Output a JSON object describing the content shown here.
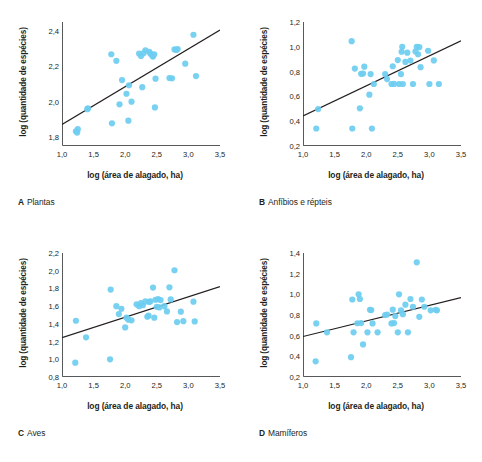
{
  "figure": {
    "axis_titles": {
      "x": "log (área de alagado, ha)",
      "y": "log (quantidade de espécies)"
    },
    "marker_color": "#6ecdf0",
    "line_color": "#231f20",
    "axis_color": "#58595b",
    "background": "#ffffff"
  },
  "chart_data": [
    {
      "type": "scatter",
      "panel": "A",
      "title": "Plantas",
      "caption_letter": "A",
      "caption_text": "Plantas",
      "xlabel": "log (área de alagado, ha)",
      "ylabel": "log (quantidade de espécies)",
      "xlim": [
        1.0,
        3.5
      ],
      "ylim": [
        1.75,
        2.45
      ],
      "xticks": [
        "1,0",
        "1,5",
        "2,0",
        "2,5",
        "3,0",
        "3,5"
      ],
      "xtick_values": [
        1.0,
        1.5,
        2.0,
        2.5,
        3.0,
        3.5
      ],
      "yticks": [
        "1,8",
        "2,0",
        "2,2",
        "2,4"
      ],
      "ytick_values": [
        1.8,
        2.0,
        2.2,
        2.4
      ],
      "grid": false,
      "legend": "none",
      "trendline": {
        "x": [
          1.0,
          3.5
        ],
        "y": [
          1.872,
          2.405
        ]
      },
      "points": [
        [
          1.22,
          1.833
        ],
        [
          1.25,
          1.845
        ],
        [
          1.24,
          1.826
        ],
        [
          1.4,
          1.958
        ],
        [
          1.41,
          1.962
        ],
        [
          1.78,
          2.268
        ],
        [
          1.79,
          1.878
        ],
        [
          1.86,
          2.231
        ],
        [
          1.91,
          1.985
        ],
        [
          1.95,
          2.122
        ],
        [
          2.02,
          2.045
        ],
        [
          2.05,
          1.893
        ],
        [
          2.06,
          2.093
        ],
        [
          2.1,
          2.0
        ],
        [
          2.22,
          2.272
        ],
        [
          2.25,
          2.258
        ],
        [
          2.27,
          2.082
        ],
        [
          2.29,
          2.274
        ],
        [
          2.32,
          2.29
        ],
        [
          2.38,
          2.282
        ],
        [
          2.4,
          2.271
        ],
        [
          2.43,
          2.259
        ],
        [
          2.44,
          2.255
        ],
        [
          2.46,
          2.268
        ],
        [
          2.47,
          1.968
        ],
        [
          2.48,
          2.13
        ],
        [
          2.7,
          2.134
        ],
        [
          2.74,
          2.132
        ],
        [
          2.78,
          2.295
        ],
        [
          2.81,
          2.292
        ],
        [
          2.83,
          2.297
        ],
        [
          2.95,
          2.215
        ],
        [
          3.08,
          2.378
        ],
        [
          3.12,
          2.145
        ]
      ]
    },
    {
      "type": "scatter",
      "panel": "B",
      "title": "Anfíbios e répteis",
      "caption_letter": "B",
      "caption_text": "Anfíbios e répteis",
      "xlabel": "log (área de alagado, ha)",
      "ylabel": "log (quantidade de espécies)",
      "xlim": [
        1.0,
        3.5
      ],
      "ylim": [
        0.2,
        1.2
      ],
      "xticks": [
        "1,0",
        "1,5",
        "2,0",
        "2,5",
        "3,0",
        "3,5"
      ],
      "xtick_values": [
        1.0,
        1.5,
        2.0,
        2.5,
        3.0,
        3.5
      ],
      "yticks": [
        "0,2",
        "0,4",
        "0,6",
        "0,8",
        "1,0",
        "1,2"
      ],
      "ytick_values": [
        0.2,
        0.4,
        0.6,
        0.8,
        1.0,
        1.2
      ],
      "grid": false,
      "legend": "none",
      "trendline": {
        "x": [
          1.0,
          3.5
        ],
        "y": [
          0.443,
          1.048
        ]
      },
      "points": [
        [
          1.21,
          0.341
        ],
        [
          1.24,
          0.498
        ],
        [
          1.77,
          1.045
        ],
        [
          1.78,
          0.341
        ],
        [
          1.82,
          0.824
        ],
        [
          1.9,
          0.504
        ],
        [
          1.92,
          0.782
        ],
        [
          1.95,
          0.784
        ],
        [
          1.97,
          0.84
        ],
        [
          2.05,
          0.614
        ],
        [
          2.07,
          0.78
        ],
        [
          2.09,
          0.341
        ],
        [
          2.12,
          0.7
        ],
        [
          2.3,
          0.78
        ],
        [
          2.33,
          0.74
        ],
        [
          2.4,
          0.7
        ],
        [
          2.42,
          0.843
        ],
        [
          2.44,
          0.701
        ],
        [
          2.5,
          0.893
        ],
        [
          2.52,
          0.7
        ],
        [
          2.55,
          0.78
        ],
        [
          2.56,
          0.96
        ],
        [
          2.57,
          1.0
        ],
        [
          2.58,
          0.7
        ],
        [
          2.62,
          0.878
        ],
        [
          2.65,
          0.953
        ],
        [
          2.7,
          0.889
        ],
        [
          2.74,
          0.7
        ],
        [
          2.78,
          0.963
        ],
        [
          2.8,
          1.0
        ],
        [
          2.82,
          0.94
        ],
        [
          2.84,
          0.997
        ],
        [
          2.86,
          0.836
        ],
        [
          2.98,
          0.968
        ],
        [
          3.0,
          0.7
        ],
        [
          3.07,
          0.89
        ],
        [
          3.15,
          0.7
        ]
      ]
    },
    {
      "type": "scatter",
      "panel": "C",
      "title": "Aves",
      "caption_letter": "C",
      "caption_text": "Aves",
      "xlabel": "log (área de alagado, ha)",
      "ylabel": "log (quantidade de espécies)",
      "xlim": [
        1.0,
        3.5
      ],
      "ylim": [
        0.8,
        2.2
      ],
      "xticks": [
        "1,0",
        "1,5",
        "2,0",
        "2,5",
        "3,0",
        "3,5"
      ],
      "xtick_values": [
        1.0,
        1.5,
        2.0,
        2.5,
        3.0,
        3.5
      ],
      "yticks": [
        "0,8",
        "1,0",
        "1,2",
        "1,4",
        "1,6",
        "1,8",
        "2,0",
        "2,2"
      ],
      "ytick_values": [
        0.8,
        1.0,
        1.2,
        1.4,
        1.6,
        1.8,
        2.0,
        2.2
      ],
      "grid": false,
      "legend": "none",
      "trendline": {
        "x": [
          1.0,
          3.5
        ],
        "y": [
          1.245,
          1.82
        ]
      },
      "points": [
        [
          1.21,
          0.962
        ],
        [
          1.22,
          1.435
        ],
        [
          1.38,
          1.248
        ],
        [
          1.76,
          1.0
        ],
        [
          1.77,
          1.787
        ],
        [
          1.86,
          1.6
        ],
        [
          1.9,
          1.51
        ],
        [
          1.94,
          1.57
        ],
        [
          2.0,
          1.36
        ],
        [
          2.02,
          1.47
        ],
        [
          2.05,
          1.447
        ],
        [
          2.1,
          1.44
        ],
        [
          2.18,
          1.62
        ],
        [
          2.22,
          1.6
        ],
        [
          2.25,
          1.635
        ],
        [
          2.28,
          1.61
        ],
        [
          2.32,
          1.653
        ],
        [
          2.35,
          1.48
        ],
        [
          2.37,
          1.492
        ],
        [
          2.38,
          1.648
        ],
        [
          2.4,
          1.655
        ],
        [
          2.44,
          1.81
        ],
        [
          2.46,
          1.47
        ],
        [
          2.48,
          1.672
        ],
        [
          2.5,
          1.592
        ],
        [
          2.52,
          1.68
        ],
        [
          2.54,
          1.585
        ],
        [
          2.56,
          1.668
        ],
        [
          2.62,
          1.6
        ],
        [
          2.66,
          1.54
        ],
        [
          2.7,
          1.812
        ],
        [
          2.72,
          1.676
        ],
        [
          2.78,
          2.005
        ],
        [
          2.82,
          1.42
        ],
        [
          2.88,
          1.538
        ],
        [
          2.92,
          1.43
        ],
        [
          3.08,
          1.65
        ],
        [
          3.1,
          1.428
        ]
      ]
    },
    {
      "type": "scatter",
      "panel": "D",
      "title": "Mamíferos",
      "caption_letter": "D",
      "caption_text": "Mamíferos",
      "xlabel": "log (área de alagado, ha)",
      "ylabel": "log (quantidade de espécies)",
      "xlim": [
        1.0,
        3.5
      ],
      "ylim": [
        0.2,
        1.4
      ],
      "xticks": [
        "1,0",
        "1,5",
        "2,0",
        "2,5",
        "3,0",
        "3,5"
      ],
      "xtick_values": [
        1.0,
        1.5,
        2.0,
        2.5,
        3.0,
        3.5
      ],
      "yticks": [
        "0,2",
        "0,4",
        "0,6",
        "0,8",
        "1,0",
        "1,2",
        "1,4"
      ],
      "ytick_values": [
        0.2,
        0.4,
        0.6,
        0.8,
        1.0,
        1.2,
        1.4
      ],
      "grid": false,
      "legend": "none",
      "trendline": {
        "x": [
          1.0,
          3.5
        ],
        "y": [
          0.592,
          0.968
        ]
      },
      "points": [
        [
          1.2,
          0.352
        ],
        [
          1.21,
          0.718
        ],
        [
          1.38,
          0.632
        ],
        [
          1.76,
          0.392
        ],
        [
          1.78,
          0.95
        ],
        [
          1.8,
          0.632
        ],
        [
          1.86,
          0.72
        ],
        [
          1.88,
          1.0
        ],
        [
          1.9,
          0.955
        ],
        [
          1.92,
          0.722
        ],
        [
          1.95,
          0.515
        ],
        [
          2.02,
          0.632
        ],
        [
          2.06,
          0.85
        ],
        [
          2.08,
          0.848
        ],
        [
          2.1,
          0.718
        ],
        [
          2.18,
          0.632
        ],
        [
          2.3,
          0.8
        ],
        [
          2.33,
          0.805
        ],
        [
          2.4,
          0.718
        ],
        [
          2.42,
          0.852
        ],
        [
          2.44,
          0.722
        ],
        [
          2.46,
          0.79
        ],
        [
          2.5,
          0.632
        ],
        [
          2.52,
          1.0
        ],
        [
          2.55,
          0.845
        ],
        [
          2.58,
          0.808
        ],
        [
          2.62,
          0.9
        ],
        [
          2.66,
          0.632
        ],
        [
          2.7,
          0.955
        ],
        [
          2.74,
          0.88
        ],
        [
          2.8,
          1.31
        ],
        [
          2.84,
          0.782
        ],
        [
          2.88,
          0.95
        ],
        [
          2.92,
          0.88
        ],
        [
          3.02,
          0.845
        ],
        [
          3.1,
          0.85
        ],
        [
          3.12,
          0.845
        ]
      ]
    }
  ]
}
